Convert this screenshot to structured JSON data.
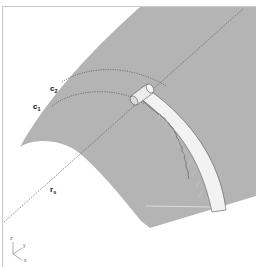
{
  "figure": {
    "colors": {
      "surface": "#b4b4b4",
      "strip": "#f2f2f2",
      "strip_edge": "#555555",
      "frame": "#c8c8c8",
      "curve": "#555555",
      "background": "#ffffff"
    },
    "labels": {
      "c2": {
        "main": "c",
        "sub": "2"
      },
      "c1": {
        "main": "c",
        "sub": "1"
      },
      "rs": {
        "main": "r",
        "sub": "s"
      }
    },
    "axes": {
      "z": "z",
      "y": "y",
      "x": "x"
    }
  }
}
